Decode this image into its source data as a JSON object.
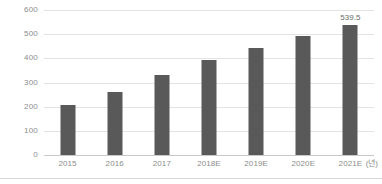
{
  "chart_data": {
    "type": "bar",
    "title": "",
    "xlabel": "",
    "ylabel": "",
    "unit_label": "(년)",
    "categories": [
      "2015",
      "2016",
      "2017",
      "2018E",
      "2019E",
      "2020E",
      "2021E"
    ],
    "values": [
      205,
      262,
      330,
      393,
      443,
      492,
      539.5
    ],
    "data_labels": [
      "",
      "",
      "",
      "",
      "",
      "",
      "539.5"
    ],
    "ylim": [
      0,
      600
    ],
    "yticks": [
      0,
      100,
      200,
      300,
      400,
      500,
      600
    ],
    "ytick_labels": [
      "0",
      "100",
      "200",
      "300",
      "400",
      "500",
      "600"
    ],
    "grid": true,
    "legend": false,
    "bar_color": "#595959",
    "gridline_color": "#e3e3e3",
    "axis_color": "#c9c9c9",
    "tick_text_color": "#8c8c8c",
    "label_text_color": "#6b6b6b"
  }
}
